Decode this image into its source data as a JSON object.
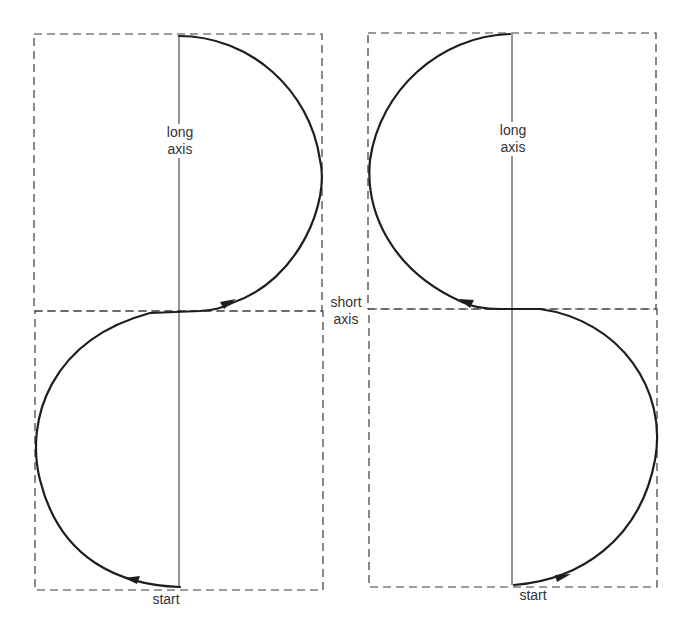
{
  "diagram": {
    "left_panel": {
      "long_axis_label_line1": "long",
      "long_axis_label_line2": "axis",
      "start_label": "start",
      "direction": "counter-clockwise lower loop, then clockwise upper loop"
    },
    "right_panel": {
      "long_axis_label_line1": "long",
      "long_axis_label_line2": "axis",
      "start_label": "start",
      "direction": "clockwise lower loop, then counter-clockwise upper loop"
    },
    "center": {
      "short_axis_label_line1": "short",
      "short_axis_label_line2": "axis"
    }
  },
  "colors": {
    "background": "#ffffff",
    "stroke": "#1e1e1e",
    "dashed_box": "#3a3a3a",
    "text": "#333333"
  }
}
